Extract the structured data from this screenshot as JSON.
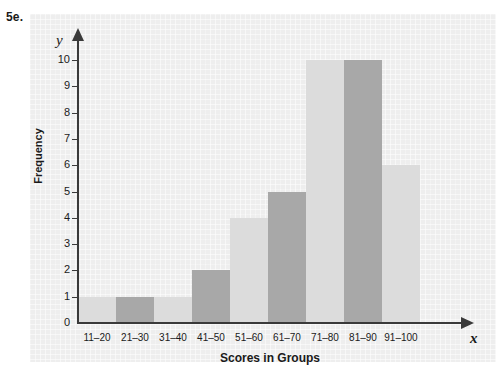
{
  "figure": {
    "label": "5e."
  },
  "axes": {
    "y_variable": "y",
    "x_variable": "x",
    "y_title": "Frequency",
    "x_title": "Scores in Groups",
    "y_ticks": [
      "10",
      "9",
      "8",
      "7",
      "6",
      "5",
      "4",
      "3",
      "2",
      "1",
      "0"
    ]
  },
  "chart_data": {
    "type": "bar",
    "title": "",
    "subtitle": "",
    "xlabel": "Scores in Groups",
    "ylabel": "Frequency",
    "categories": [
      "11–20",
      "21–30",
      "31–40",
      "41–50",
      "51–60",
      "61–70",
      "71–80",
      "81–90",
      "91–100"
    ],
    "values": [
      1,
      1,
      1,
      2,
      4,
      5,
      10,
      10,
      6
    ],
    "bar_colors": [
      "#dcdcdc",
      "#a8a8a8",
      "#dcdcdc",
      "#a8a8a8",
      "#dcdcdc",
      "#a8a8a8",
      "#dcdcdc",
      "#a8a8a8",
      "#dcdcdc"
    ],
    "ylim": [
      0,
      10
    ],
    "y_tick_step": 1,
    "grid": true,
    "legend": "none",
    "orientation": "vertical",
    "bar_gap": 0
  },
  "colors": {
    "panel_background": "#eeeeee",
    "axis": "#3a3a3a",
    "bar_light": "#dcdcdc",
    "bar_dark": "#a8a8a8",
    "text": "#1a1a1a"
  }
}
